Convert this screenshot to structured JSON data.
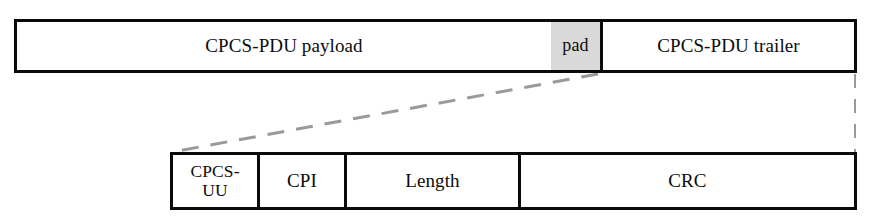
{
  "figure": {
    "background_color": "#ffffff",
    "line_color": "#0a0a0a",
    "pad_fill_color": "#d9d9d9",
    "guide_color": "#9a9a9a"
  },
  "pdu_bar": {
    "name": "CPCS-PDU",
    "fields": [
      {
        "label": "CPCS-PDU payload",
        "width_px": 534,
        "fill": "white"
      },
      {
        "label": "pad",
        "width_px": 49,
        "fill": "gray"
      },
      {
        "label": "CPCS-PDU trailer",
        "width_px": 254,
        "fill": "white"
      }
    ]
  },
  "trailer_bar": {
    "name": "CPCS-PDU trailer detail",
    "fields": [
      {
        "label": "CPCS-\nUU",
        "width_px": 84,
        "fill": "white"
      },
      {
        "label": "CPI",
        "width_px": 87,
        "fill": "white"
      },
      {
        "label": "Length",
        "width_px": 174,
        "fill": "white"
      },
      {
        "label": "CRC",
        "width_px": 336,
        "fill": "white"
      }
    ]
  },
  "connectors": {
    "diagonal_guide": "dashed line from pad/trailer boundary down-left to trailer detail left edge",
    "vertical_guide": "dashed line from PDU right edge down to trailer detail right edge"
  }
}
